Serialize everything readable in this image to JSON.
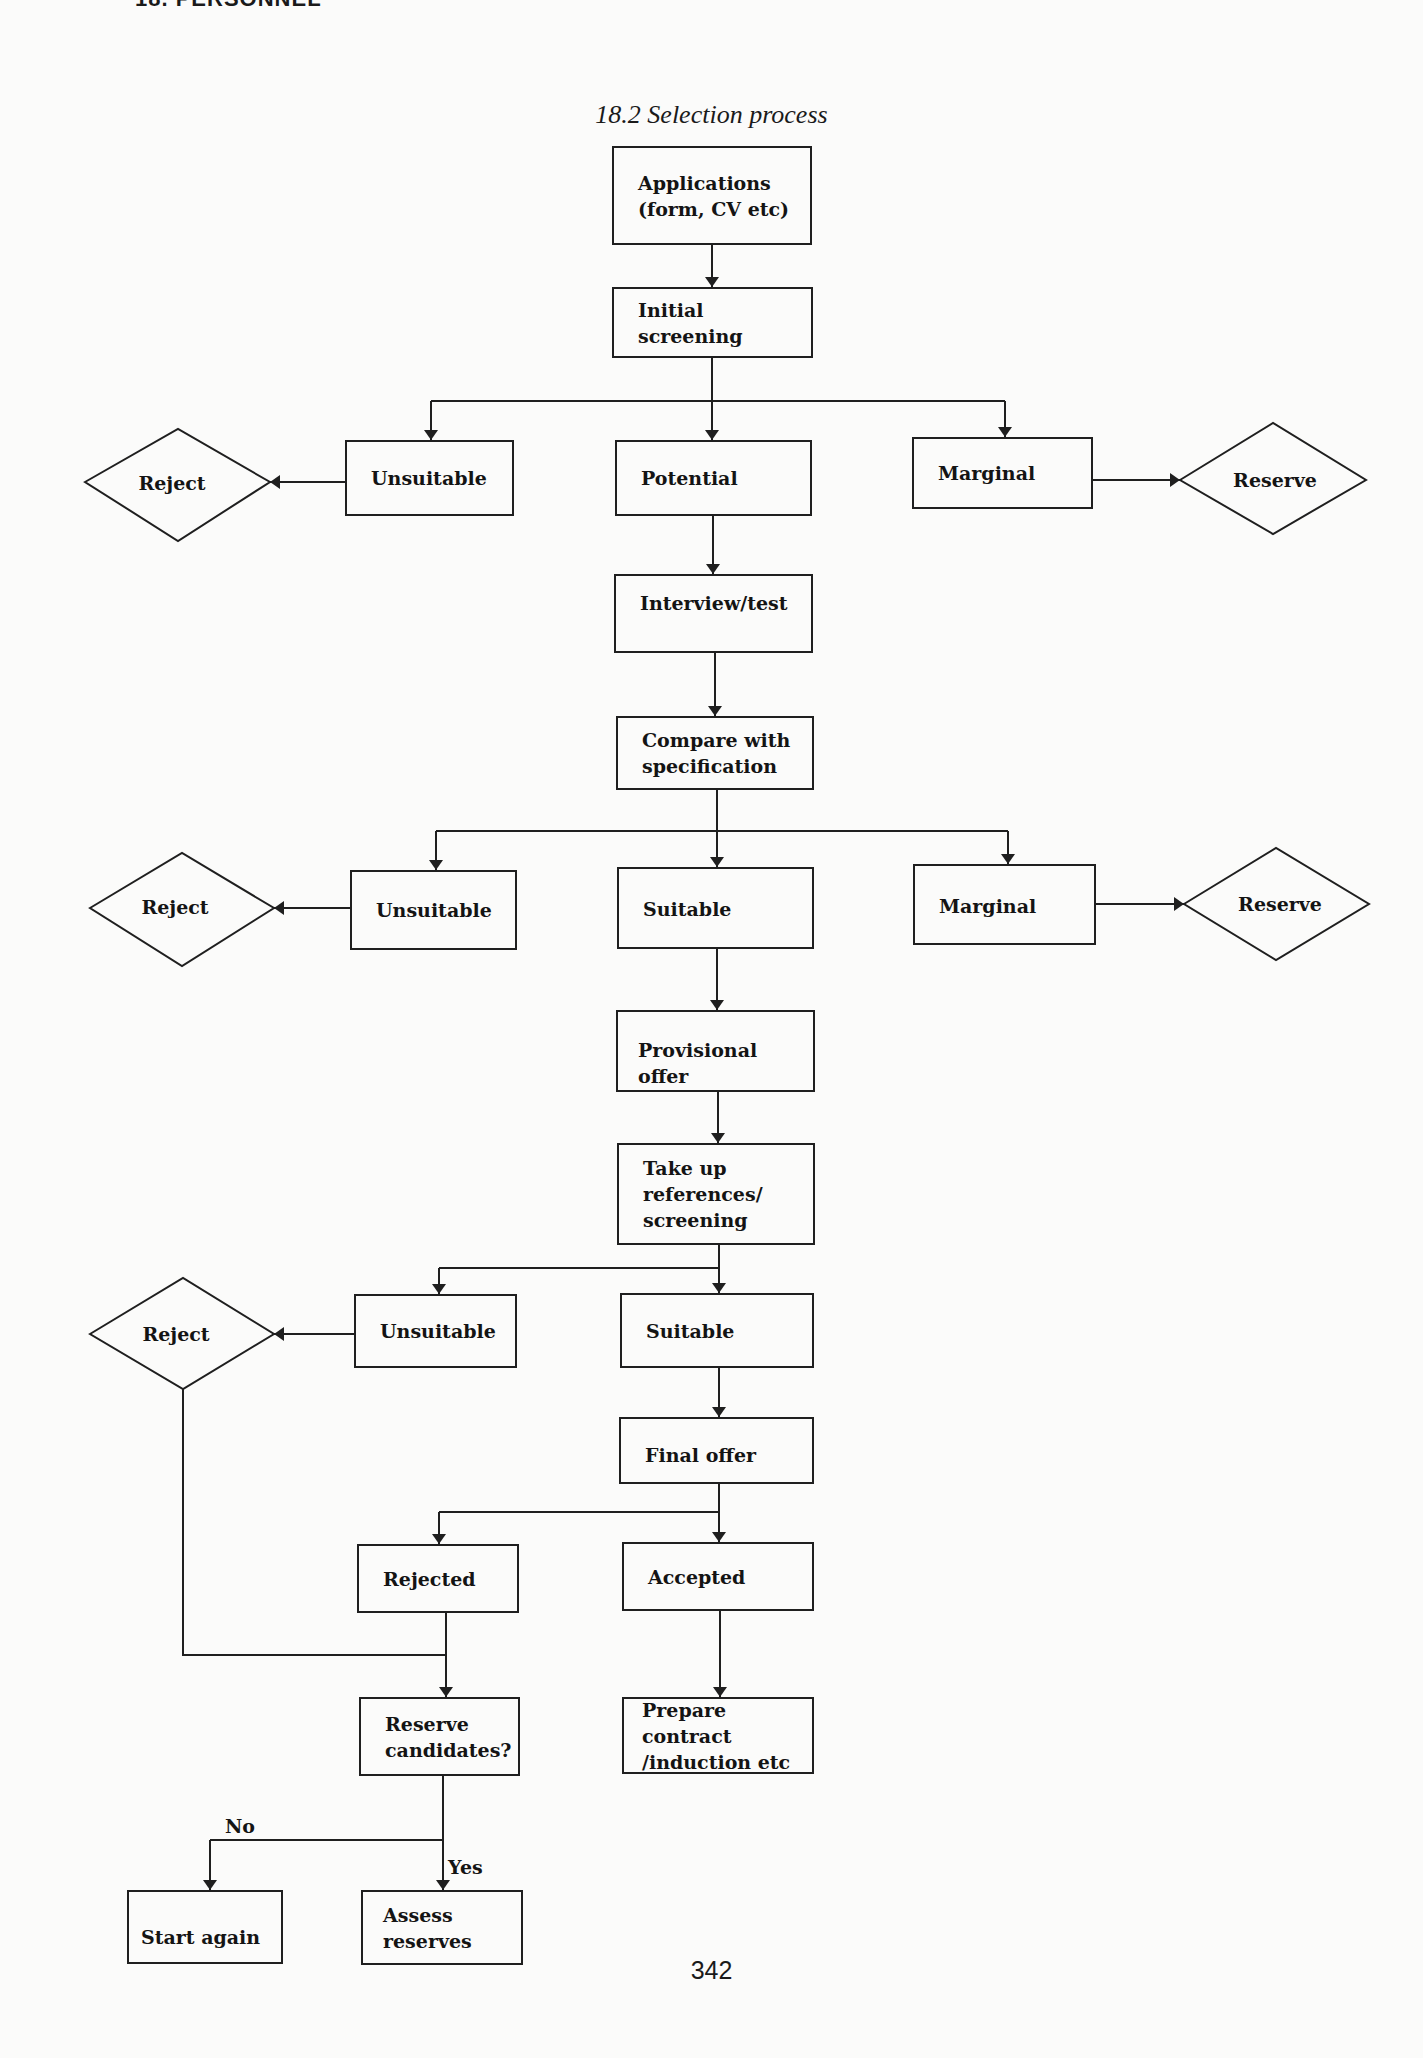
{
  "page": {
    "running_header": "18. PERSONNEL",
    "figure_title": "18.2 Selection process",
    "page_number": "342"
  },
  "flow": {
    "applications": "Applications\n(form, CV etc)",
    "initial_screening": "Initial\nscreening",
    "stage1": {
      "reject": "Reject",
      "unsuitable": "Unsuitable",
      "potential": "Potential",
      "marginal": "Marginal",
      "reserve": "Reserve"
    },
    "interview": "Interview/test",
    "compare": "Compare with\nspecification",
    "stage2": {
      "reject": "Reject",
      "unsuitable": "Unsuitable",
      "suitable": "Suitable",
      "marginal": "Marginal",
      "reserve": "Reserve"
    },
    "provisional_offer": "Provisional offer",
    "take_up_references": "Take up\nreferences/\nscreening",
    "stage3": {
      "reject": "Reject",
      "unsuitable": "Unsuitable",
      "suitable": "Suitable"
    },
    "final_offer": "Final  offer",
    "rejected": "Rejected",
    "accepted": "Accepted",
    "reserve_candidates": "Reserve\ncandidates?",
    "prepare_contract": "Prepare contract\n/induction etc",
    "branch_no": "No",
    "branch_yes": "Yes",
    "start_again": "Start again",
    "assess_reserves": "Assess\nreserves"
  },
  "colors": {
    "ink": "#1f1f1f",
    "paper": "#fbfbfa"
  }
}
